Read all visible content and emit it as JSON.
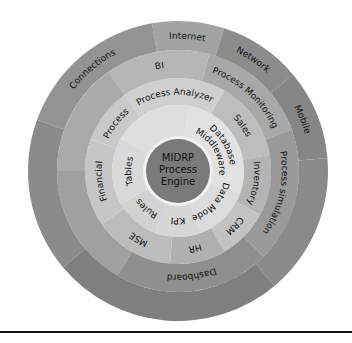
{
  "diagram": {
    "center": {
      "x": 178,
      "y": 171
    },
    "core": {
      "label_lines": [
        "MIDRP",
        "Process",
        "Engine"
      ],
      "radius": 32,
      "color": "#7a7a7a",
      "ring_color": "#f2f2f2"
    },
    "rings": [
      {
        "name": "ring-1",
        "r_inner": 34,
        "r_outer": 66,
        "segments": [
          {
            "label": "Database Middleware",
            "lines": [
              "Database",
              "Middleware"
            ],
            "start": -80,
            "end": 20,
            "color": "#e2e2e2"
          },
          {
            "label": "Data Model",
            "start": 20,
            "end": 70,
            "color": "#dcdcdc"
          },
          {
            "label": "KPI",
            "start": 70,
            "end": 110,
            "color": "#d6d6d6"
          },
          {
            "label": "Rules",
            "start": 110,
            "end": 150,
            "color": "#d2d2d2"
          },
          {
            "label": "Tables",
            "start": 150,
            "end": 210,
            "color": "#d9d9d9"
          },
          {
            "label": "",
            "start": 210,
            "end": 280,
            "color": "#dedede"
          }
        ]
      },
      {
        "name": "ring-2",
        "r_inner": 66,
        "r_outer": 93,
        "segments": [
          {
            "label": "Process Analyzer",
            "start": -125,
            "end": -60,
            "color": "#cfcfcf"
          },
          {
            "label": "Sales",
            "start": -60,
            "end": -10,
            "color": "#bdbdbd"
          },
          {
            "label": "Inventory",
            "start": -10,
            "end": 28,
            "color": "#b4b4b4"
          },
          {
            "label": "CRM",
            "start": 28,
            "end": 60,
            "color": "#c3c3c3"
          },
          {
            "label": "HR",
            "start": 60,
            "end": 95,
            "color": "#b0b0b0"
          },
          {
            "label": "MSE",
            "start": 95,
            "end": 145,
            "color": "#bcbcbc"
          },
          {
            "label": "Financial",
            "start": 145,
            "end": 200,
            "color": "#c6c6c6"
          },
          {
            "label": "Process",
            "start": 200,
            "end": 235,
            "color": "#c9c9c9"
          }
        ]
      },
      {
        "name": "ring-3",
        "r_inner": 93,
        "r_outer": 121,
        "segments": [
          {
            "label": "BI",
            "start": -125,
            "end": -75,
            "color": "#b6b6b6"
          },
          {
            "label": "Process Monitoring",
            "start": -75,
            "end": -20,
            "color": "#a8a8a8"
          },
          {
            "label": "Process simulation",
            "start": -20,
            "end": 45,
            "color": "#9a9a9a"
          },
          {
            "label": "Dashboard",
            "start": 45,
            "end": 120,
            "color": "#8f8f8f"
          },
          {
            "label": "",
            "start": 120,
            "end": 180,
            "color": "#a0a0a0"
          },
          {
            "label": "",
            "start": 180,
            "end": 235,
            "color": "#aaaaaa"
          }
        ]
      },
      {
        "name": "ring-4",
        "r_inner": 121,
        "r_outer": 150,
        "segments": [
          {
            "label": "Internet",
            "start": -100,
            "end": -72,
            "color": "#a3a3a3"
          },
          {
            "label": "Network",
            "start": -72,
            "end": -40,
            "color": "#8c8c8c"
          },
          {
            "label": "Mobile",
            "start": -40,
            "end": -5,
            "color": "#868686"
          },
          {
            "label": "",
            "start": -5,
            "end": 50,
            "color": "#8a8a8a"
          },
          {
            "label": "",
            "start": 50,
            "end": 140,
            "color": "#7f7f7f"
          },
          {
            "label": "",
            "start": 140,
            "end": 200,
            "color": "#8b8b8b"
          },
          {
            "label": "Connections",
            "start": 200,
            "end": 260,
            "color": "#939393"
          }
        ]
      }
    ]
  },
  "footer": {
    "rule": true
  }
}
